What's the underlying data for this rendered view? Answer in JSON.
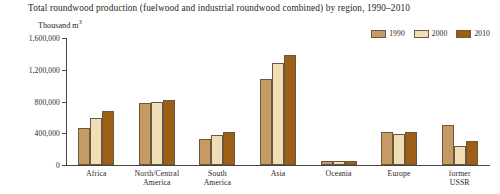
{
  "chart_data": {
    "type": "bar",
    "title": "Total roundwood production (fuelwood and industrial roundwood combined) by region, 1990–2010",
    "ylabel": "Thousand m",
    "ylabel_sup": "3",
    "xlabel": "",
    "ylim": [
      0,
      1600000
    ],
    "ytick_labels": [
      "1,600,000",
      "1,200,000",
      "800,000",
      "400,000",
      "0"
    ],
    "ytick_values": [
      1600000,
      1200000,
      800000,
      400000,
      0
    ],
    "grid": false,
    "legend_position": "top-right",
    "categories": [
      "Africa",
      "North/Central\nAmerica",
      "South America",
      "Asia",
      "Oceania",
      "Europe",
      "former USSR"
    ],
    "series": [
      {
        "name": "1990",
        "color": "#c59a63",
        "values": [
          470000,
          775000,
          330000,
          1080000,
          45000,
          410000,
          500000
        ]
      },
      {
        "name": "2000",
        "color": "#f0dfb6",
        "values": [
          590000,
          790000,
          375000,
          1280000,
          50000,
          390000,
          240000
        ]
      },
      {
        "name": "2010",
        "color": "#9c5f15",
        "values": [
          680000,
          815000,
          415000,
          1390000,
          55000,
          420000,
          300000
        ]
      }
    ]
  },
  "legend": {
    "items": [
      {
        "label": "1990",
        "color": "#c59a63"
      },
      {
        "label": "2000",
        "color": "#f0dfb6"
      },
      {
        "label": "2010",
        "color": "#9c5f15"
      }
    ]
  }
}
